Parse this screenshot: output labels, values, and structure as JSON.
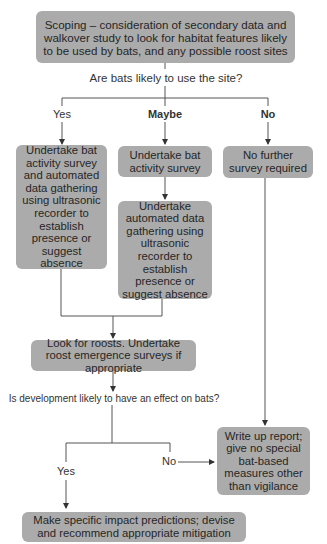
{
  "diagram": {
    "type": "flowchart",
    "nodes": {
      "scoping": "Scoping – consideration of secondary data and walkover study to look for habitat features likely to be used by bats, and any possible roost sites",
      "q1": "Are bats likely to use the site?",
      "yes1": "Yes",
      "maybe1": "Maybe",
      "no1": "No",
      "yes_action": "Undertake bat activity survey and automated data gathering using ultrasonic recorder to establish presence or suggest absence",
      "maybe_action1": "Undertake bat activity survey",
      "maybe_action2": "Undertake automated data gathering using ultrasonic recorder to establish presence or suggest absence",
      "no_action": "No further survey required",
      "roosts": "Look for roosts. Undertake roost emergence surveys if appropriate",
      "q2": "Is development likely to have an effect on bats?",
      "yes2": "Yes",
      "no2": "No",
      "report": "Write up report; give no special bat-based measures other than vigilance",
      "mitigation": "Make specific impact predictions; devise and recommend appropriate mitigation"
    },
    "colors": {
      "box": "#ababab",
      "line": "#444444",
      "text": "#262626"
    }
  }
}
